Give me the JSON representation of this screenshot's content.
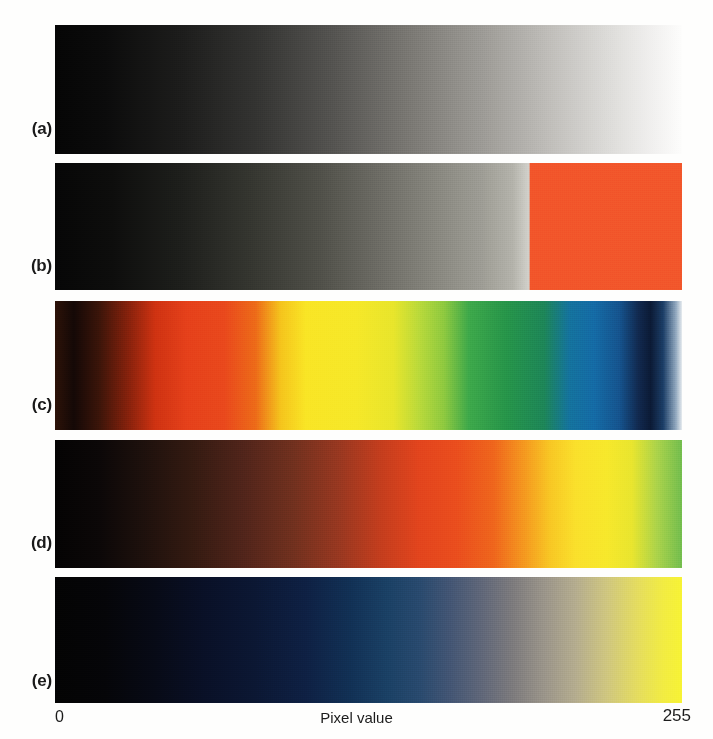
{
  "figure": {
    "caption_letters": [
      "(a)",
      "(b)",
      "(c)",
      "(d)",
      "(e)"
    ],
    "axis": {
      "title": "Pixel value",
      "min_label": "0",
      "max_label": "255"
    },
    "background_color": "#fefefd",
    "text_color": "#1a1a1a"
  },
  "chart_data": {
    "type": "heatmap",
    "title": "",
    "subtitle": "",
    "xlabel": "Pixel value",
    "ylabel": "",
    "xlim": [
      0,
      255
    ],
    "xtick_labels": [
      "0",
      "255"
    ],
    "grid": false,
    "legend": "none",
    "annotations": [
      "(a)",
      "(b)",
      "(c)",
      "(d)",
      "(e)"
    ],
    "panels": [
      {
        "letter": "(a)",
        "name": "grayscale",
        "stops": [
          {
            "pos": 0,
            "value": 0,
            "color": "#050505"
          },
          {
            "pos": 8,
            "value": 20,
            "color": "#0b0b0b"
          },
          {
            "pos": 20,
            "value": 51,
            "color": "#1c1c1b"
          },
          {
            "pos": 32,
            "value": 82,
            "color": "#333331"
          },
          {
            "pos": 45,
            "value": 115,
            "color": "#565552"
          },
          {
            "pos": 57,
            "value": 145,
            "color": "#7b7974"
          },
          {
            "pos": 68,
            "value": 173,
            "color": "#9c9a95"
          },
          {
            "pos": 79,
            "value": 201,
            "color": "#c0beba"
          },
          {
            "pos": 88,
            "value": 224,
            "color": "#dcdbd8"
          },
          {
            "pos": 95,
            "value": 242,
            "color": "#f0efee"
          },
          {
            "pos": 100,
            "value": 255,
            "color": "#fdfdfc"
          }
        ]
      },
      {
        "letter": "(b)",
        "name": "grayscale-with-saturation-overlay",
        "saturation_break_percent": 75.8,
        "saturation_color": "#f2552a",
        "stops": [
          {
            "pos": 0,
            "value": 0,
            "color": "#060606"
          },
          {
            "pos": 9,
            "value": 23,
            "color": "#0d0d0c"
          },
          {
            "pos": 20,
            "value": 51,
            "color": "#1d1e1b"
          },
          {
            "pos": 31,
            "value": 79,
            "color": "#34352f"
          },
          {
            "pos": 42,
            "value": 107,
            "color": "#4f4f48"
          },
          {
            "pos": 52,
            "value": 133,
            "color": "#6d6c65"
          },
          {
            "pos": 61,
            "value": 156,
            "color": "#88877f"
          },
          {
            "pos": 68,
            "value": 173,
            "color": "#9d9c94"
          },
          {
            "pos": 73,
            "value": 186,
            "color": "#b3b2aa"
          },
          {
            "pos": 75.6,
            "value": 193,
            "color": "#d2d1cb"
          },
          {
            "pos": 75.8,
            "value": 193,
            "color": "#f2552a"
          },
          {
            "pos": 100,
            "value": 255,
            "color": "#f2562b"
          }
        ]
      },
      {
        "letter": "(c)",
        "name": "spectrum-rainbow",
        "stops": [
          {
            "pos": 0,
            "value": 0,
            "color": "#2c1208"
          },
          {
            "pos": 3,
            "value": 8,
            "color": "#140806"
          },
          {
            "pos": 7,
            "value": 18,
            "color": "#3a1409"
          },
          {
            "pos": 12,
            "value": 31,
            "color": "#8b220c"
          },
          {
            "pos": 16,
            "value": 41,
            "color": "#cf3211"
          },
          {
            "pos": 21,
            "value": 54,
            "color": "#e5401a"
          },
          {
            "pos": 27,
            "value": 69,
            "color": "#e9481c"
          },
          {
            "pos": 32,
            "value": 82,
            "color": "#ed6a18"
          },
          {
            "pos": 36,
            "value": 92,
            "color": "#f5c41c"
          },
          {
            "pos": 40,
            "value": 102,
            "color": "#f9e525"
          },
          {
            "pos": 48,
            "value": 122,
            "color": "#f6e828"
          },
          {
            "pos": 54,
            "value": 138,
            "color": "#e8e52b"
          },
          {
            "pos": 58,
            "value": 148,
            "color": "#bada3a"
          },
          {
            "pos": 62,
            "value": 158,
            "color": "#8ec93f"
          },
          {
            "pos": 66,
            "value": 168,
            "color": "#3da84a"
          },
          {
            "pos": 72,
            "value": 184,
            "color": "#269449"
          },
          {
            "pos": 78,
            "value": 199,
            "color": "#1d8557"
          },
          {
            "pos": 82,
            "value": 209,
            "color": "#14729d"
          },
          {
            "pos": 86,
            "value": 219,
            "color": "#146aa5"
          },
          {
            "pos": 90,
            "value": 230,
            "color": "#15538d"
          },
          {
            "pos": 93,
            "value": 237,
            "color": "#11294f"
          },
          {
            "pos": 95,
            "value": 242,
            "color": "#0b1a35"
          },
          {
            "pos": 97,
            "value": 247,
            "color": "#1b3d66"
          },
          {
            "pos": 99,
            "value": 252,
            "color": "#8fa6bd"
          },
          {
            "pos": 100,
            "value": 255,
            "color": "#e6ebef"
          }
        ]
      },
      {
        "letter": "(d)",
        "name": "heated-object",
        "stops": [
          {
            "pos": 0,
            "value": 0,
            "color": "#040303"
          },
          {
            "pos": 7,
            "value": 18,
            "color": "#0b0707"
          },
          {
            "pos": 14,
            "value": 36,
            "color": "#1d100c"
          },
          {
            "pos": 22,
            "value": 56,
            "color": "#341a11"
          },
          {
            "pos": 30,
            "value": 77,
            "color": "#50241a"
          },
          {
            "pos": 38,
            "value": 97,
            "color": "#70301e"
          },
          {
            "pos": 45,
            "value": 115,
            "color": "#963720"
          },
          {
            "pos": 52,
            "value": 133,
            "color": "#c43d1d"
          },
          {
            "pos": 58,
            "value": 148,
            "color": "#e2441d"
          },
          {
            "pos": 64,
            "value": 163,
            "color": "#ea4d1d"
          },
          {
            "pos": 70,
            "value": 179,
            "color": "#ef651c"
          },
          {
            "pos": 75,
            "value": 191,
            "color": "#f59a1f"
          },
          {
            "pos": 79,
            "value": 201,
            "color": "#f8c724"
          },
          {
            "pos": 83,
            "value": 212,
            "color": "#fae02b"
          },
          {
            "pos": 88,
            "value": 224,
            "color": "#f7e82b"
          },
          {
            "pos": 92,
            "value": 235,
            "color": "#e9e52e"
          },
          {
            "pos": 96,
            "value": 245,
            "color": "#abd34a"
          },
          {
            "pos": 100,
            "value": 255,
            "color": "#72bd4e"
          }
        ]
      },
      {
        "letter": "(e)",
        "name": "blue-to-yellow",
        "stops": [
          {
            "pos": 0,
            "value": 0,
            "color": "#030303"
          },
          {
            "pos": 8,
            "value": 20,
            "color": "#050508"
          },
          {
            "pos": 16,
            "value": 41,
            "color": "#070a16"
          },
          {
            "pos": 24,
            "value": 61,
            "color": "#091027"
          },
          {
            "pos": 32,
            "value": 82,
            "color": "#0b1733"
          },
          {
            "pos": 40,
            "value": 102,
            "color": "#0e2043"
          },
          {
            "pos": 47,
            "value": 120,
            "color": "#113054"
          },
          {
            "pos": 53,
            "value": 135,
            "color": "#1a4064"
          },
          {
            "pos": 58,
            "value": 148,
            "color": "#28496d"
          },
          {
            "pos": 63,
            "value": 161,
            "color": "#435573"
          },
          {
            "pos": 68,
            "value": 173,
            "color": "#5f6678"
          },
          {
            "pos": 73,
            "value": 186,
            "color": "#7c7a7c"
          },
          {
            "pos": 78,
            "value": 199,
            "color": "#9a9489"
          },
          {
            "pos": 83,
            "value": 212,
            "color": "#b4ac8e"
          },
          {
            "pos": 88,
            "value": 224,
            "color": "#cfc67f"
          },
          {
            "pos": 93,
            "value": 237,
            "color": "#e5dd5e"
          },
          {
            "pos": 97,
            "value": 247,
            "color": "#f2ec42"
          },
          {
            "pos": 100,
            "value": 255,
            "color": "#f7f334"
          }
        ]
      }
    ]
  }
}
